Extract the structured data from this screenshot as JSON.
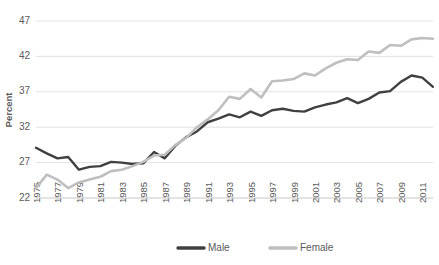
{
  "chart_data": {
    "type": "line",
    "title": "",
    "xlabel": "",
    "ylabel": "Percent",
    "ylim": [
      22,
      47
    ],
    "yticks": [
      22,
      27,
      32,
      37,
      42,
      47
    ],
    "grid": true,
    "legend_position": "bottom",
    "x": [
      1975,
      1976,
      1977,
      1978,
      1979,
      1980,
      1981,
      1982,
      1983,
      1984,
      1985,
      1986,
      1987,
      1988,
      1989,
      1990,
      1991,
      1992,
      1993,
      1994,
      1995,
      1996,
      1997,
      1998,
      1999,
      2000,
      2001,
      2002,
      2003,
      2004,
      2005,
      2006,
      2007,
      2008,
      2009,
      2010,
      2011,
      2012
    ],
    "xtick_labels": [
      "1975",
      "1977",
      "1979",
      "1981",
      "1983",
      "1985",
      "1987",
      "1989",
      "1991",
      "1993",
      "1995",
      "1997",
      "1999",
      "2001",
      "2003",
      "2005",
      "2007",
      "2009",
      "2011"
    ],
    "series": [
      {
        "name": "Male",
        "color": "#404040",
        "values": [
          29.1,
          28.3,
          27.6,
          27.8,
          26.0,
          26.4,
          26.5,
          27.1,
          27.0,
          26.8,
          26.9,
          28.5,
          27.6,
          29.4,
          30.6,
          31.4,
          32.7,
          33.2,
          33.8,
          33.4,
          34.2,
          33.6,
          34.4,
          34.6,
          34.3,
          34.2,
          34.8,
          35.2,
          35.5,
          36.1,
          35.4,
          36.0,
          36.9,
          37.1,
          38.4,
          39.3,
          39.0,
          37.7
        ]
      },
      {
        "name": "Female",
        "color": "#bfbfbf",
        "values": [
          23.4,
          25.3,
          24.6,
          23.4,
          24.2,
          24.6,
          25.0,
          25.8,
          26.0,
          26.5,
          27.1,
          28.0,
          28.1,
          29.5,
          30.5,
          32.0,
          33.1,
          34.4,
          36.3,
          36.0,
          37.4,
          36.2,
          38.5,
          38.6,
          38.8,
          39.6,
          39.3,
          40.3,
          41.1,
          41.6,
          41.5,
          42.7,
          42.5,
          43.6,
          43.5,
          44.4,
          44.6,
          44.5
        ]
      }
    ],
    "legend": [
      {
        "label": "Male",
        "color": "#404040"
      },
      {
        "label": "Female",
        "color": "#bfbfbf"
      }
    ]
  }
}
